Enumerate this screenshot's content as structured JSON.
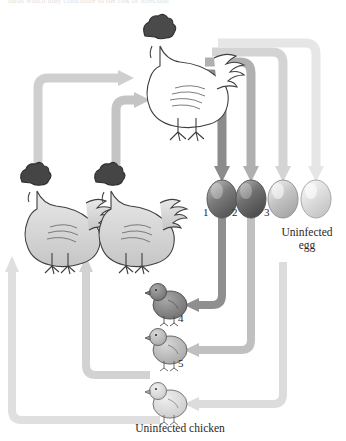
{
  "figure": {
    "type": "cycle-diagram",
    "top_text": "birds which may contribute to the risk of infection",
    "background": "#ffffff"
  },
  "palette": {
    "arrow_dark": "#8c8c8c",
    "arrow_mid": "#b5b5b5",
    "arrow_light": "#d2d2d2",
    "arrow_lightest": "#e2e2e2",
    "egg_dark": "#6f6f6f",
    "egg_mid": "#8a8a8a",
    "egg_light": "#c2c2c2",
    "egg_lightest": "#dcdcdc",
    "outline": "#3a3a3a",
    "text": "#2a2725"
  },
  "nodes": {
    "source_hen": {
      "name": "infected source hen",
      "shade": "white"
    },
    "left_hens": [
      {
        "name": "hen-left-1",
        "shade": "light-gray"
      },
      {
        "name": "hen-left-2",
        "shade": "light-gray"
      }
    ],
    "eggs": [
      {
        "label": "1",
        "shade": "dark",
        "infected": true
      },
      {
        "label": "2",
        "shade": "dark",
        "infected": true
      },
      {
        "label": "3",
        "shade": "light",
        "infected": true
      },
      {
        "label": "",
        "shade": "lightest",
        "infected": false
      }
    ],
    "chicks": [
      {
        "label": "4",
        "shade": "dark"
      },
      {
        "label": "5",
        "shade": "mid"
      },
      {
        "label": "",
        "shade": "lightest"
      }
    ]
  },
  "captions": {
    "uninfected_egg_line1": "Uninfected",
    "uninfected_egg_line2": "egg",
    "uninfected_chicken": "Uninfected chicken"
  },
  "egg_labels": {
    "one": "1",
    "two": "2",
    "three": "3"
  },
  "chick_labels": {
    "four": "4",
    "five": "5"
  }
}
